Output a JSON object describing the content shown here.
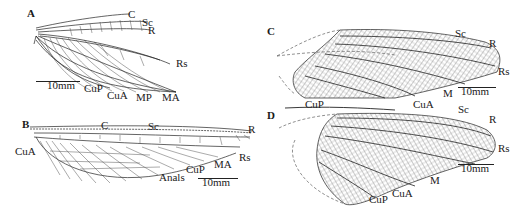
{
  "figure": {
    "panels": [
      {
        "id": "A",
        "label": "A",
        "description": "forewing line drawing",
        "vein_labels": {
          "C": "C",
          "Sc": "Sc",
          "R": "R",
          "Rs": "Rs",
          "CuP": "CuP",
          "CuA": "CuA",
          "MP": "MP",
          "MA": "MA"
        },
        "scale_bar": "10mm"
      },
      {
        "id": "B",
        "label": "B",
        "description": "hindwing line drawing",
        "vein_labels": {
          "C": "C",
          "Sc": "Sc",
          "R": "R",
          "Rs": "Rs",
          "CuA": "CuA",
          "CuP": "CuP",
          "MA": "MA",
          "Anals": "Anals"
        },
        "scale_bar": "10mm"
      },
      {
        "id": "C",
        "label": "C",
        "description": "forewing photograph-style dense venation drawing",
        "vein_labels": {
          "Sc": "Sc",
          "R": "R",
          "Rs": "Rs",
          "CuP": "CuP",
          "CuA": "CuA",
          "M": "M"
        },
        "scale_bar": "10mm"
      },
      {
        "id": "D",
        "label": "D",
        "description": "hindwing dense venation drawing",
        "vein_labels": {
          "Sc": "Sc",
          "R": "R",
          "Rs": "Rs",
          "M": "M",
          "CuA": "CuA",
          "CuP": "CuP"
        },
        "scale_bar": "10mm"
      }
    ],
    "colors": {
      "background": "#ffffff",
      "ink": "#1a1a1a",
      "hatch": "#555555"
    }
  }
}
